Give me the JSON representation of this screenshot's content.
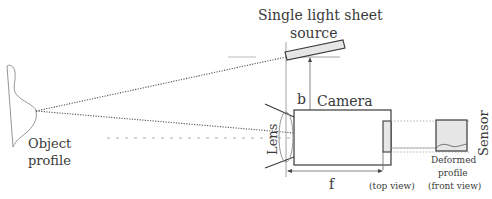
{
  "diagram": {
    "title_line1": "Single light sheet",
    "title_line2": "source",
    "object_label_line1": "Object",
    "object_label_line2": "profile",
    "camera_label": "Camera",
    "lens_label": "Lens",
    "distance_b_label": "b",
    "focal_f_label": "f",
    "top_view_label": "(top view)",
    "sensor_label": "Sensor",
    "deformed_line1": "Deformed",
    "deformed_line2": "profile",
    "front_view_label": "(front view)"
  },
  "colors": {
    "line": "#4a4a4a",
    "light_line": "#8a8a8a",
    "fill": "#e6e6e6",
    "text": "#3a3a3a"
  }
}
